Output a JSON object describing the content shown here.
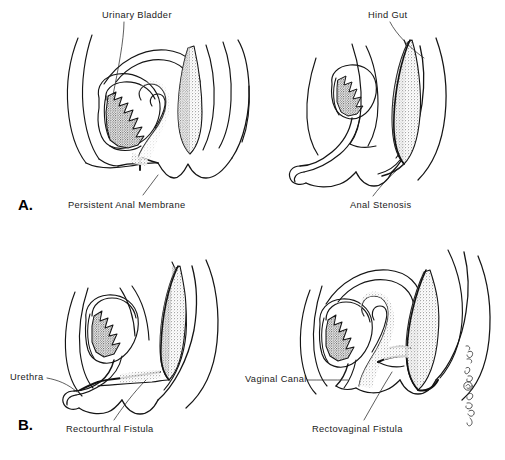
{
  "figure": {
    "background_color": "#ffffff",
    "ink_color": "#111111",
    "line_color": "#1a1a1a",
    "stipple_color": "#333333",
    "width": 505,
    "height": 460
  },
  "panels": [
    {
      "letter": "A.",
      "row": 1,
      "diagrams": [
        {
          "id": "a-left",
          "description": "Sagittal section: persistent anal membrane",
          "labels": [
            {
              "text": "Urinary Bladder",
              "position": "top",
              "leader": true
            },
            {
              "text": "Persistent Anal Membrane",
              "position": "bottom",
              "leader": true
            }
          ]
        },
        {
          "id": "a-right",
          "description": "Sagittal section: anal stenosis",
          "labels": [
            {
              "text": "Hind Gut",
              "position": "top",
              "leader": true
            },
            {
              "text": "Anal Stenosis",
              "position": "bottom",
              "leader": true
            }
          ]
        }
      ]
    },
    {
      "letter": "B.",
      "row": 2,
      "diagrams": [
        {
          "id": "b-left",
          "description": "Sagittal section: rectourthral fistula",
          "labels": [
            {
              "text": "Urethra",
              "position": "left",
              "leader": true
            },
            {
              "text": "Rectourthral Fistula",
              "position": "bottom",
              "leader": true
            }
          ]
        },
        {
          "id": "b-right",
          "description": "Sagittal section: rectovaginal fistula",
          "labels": [
            {
              "text": "Vaginal Canal",
              "position": "left",
              "leader": true
            },
            {
              "text": "Rectovaginal Fistula",
              "position": "bottom",
              "leader": true
            }
          ]
        }
      ]
    }
  ],
  "labels": {
    "urinary_bladder": "Urinary Bladder",
    "persistent_anal_membrane": "Persistent Anal Membrane",
    "hind_gut": "Hind Gut",
    "anal_stenosis": "Anal Stenosis",
    "urethra": "Urethra",
    "rectourthral_fistula": "Rectourthral Fistula",
    "vaginal_canal": "Vaginal Canal",
    "rectovaginal_fistula": "Rectovaginal Fistula",
    "panel_a": "A.",
    "panel_b": "B."
  },
  "signature": {
    "text": "artist signature",
    "orientation": "vertical",
    "position": "bottom-right"
  }
}
